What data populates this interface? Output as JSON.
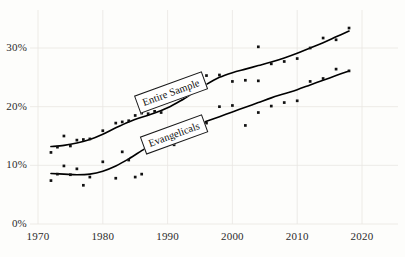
{
  "chart_data": {
    "type": "scatter",
    "title": "",
    "subtitle": "",
    "xlabel": "",
    "ylabel": "",
    "xlim": [
      1970,
      2020
    ],
    "ylim": [
      0,
      35
    ],
    "grid": true,
    "legend_position": "inline-annotation",
    "background_color": "#fdfdfb",
    "marker_color": "#111111",
    "line_color": "#000000",
    "grid_color": "#e8e6e2",
    "x_ticks": [
      1970,
      1980,
      1990,
      2000,
      2010,
      2020
    ],
    "x_tick_labels": [
      "1970",
      "1980",
      "1990",
      "2000",
      "2010",
      "2020"
    ],
    "y_ticks": [
      0,
      10,
      20,
      30
    ],
    "y_tick_labels": [
      "0%",
      "10%",
      "20%",
      "30%"
    ],
    "annotations": [
      {
        "text": "Entire Sample",
        "x": 1990.5,
        "y": 22.5,
        "rotation": -20
      },
      {
        "text": "Evangelicals",
        "x": 1991.0,
        "y": 15.2,
        "rotation": -20
      }
    ],
    "series": [
      {
        "name": "Entire Sample",
        "marker": "square",
        "points": [
          [
            1972,
            12.2
          ],
          [
            1973,
            13.1
          ],
          [
            1974,
            15.0
          ],
          [
            1975,
            13.3
          ],
          [
            1976,
            14.3
          ],
          [
            1977,
            14.4
          ],
          [
            1978,
            14.5
          ],
          [
            1980,
            15.9
          ],
          [
            1982,
            17.2
          ],
          [
            1983,
            17.4
          ],
          [
            1984,
            17.6
          ],
          [
            1985,
            18.5
          ],
          [
            1986,
            18.9
          ],
          [
            1987,
            18.8
          ],
          [
            1988,
            19.2
          ],
          [
            1989,
            19.0
          ],
          [
            1993,
            24.5
          ],
          [
            1996,
            25.3
          ],
          [
            1998,
            25.4
          ],
          [
            2000,
            24.3
          ],
          [
            2002,
            24.5
          ],
          [
            2004,
            30.2
          ],
          [
            2004,
            24.4
          ],
          [
            2006,
            27.3
          ],
          [
            2008,
            27.7
          ],
          [
            2010,
            28.2
          ],
          [
            2012,
            30.0
          ],
          [
            2014,
            31.7
          ],
          [
            2016,
            31.4
          ],
          [
            2018,
            33.4
          ]
        ],
        "fit_curve": [
          [
            1972,
            13.2
          ],
          [
            1974,
            13.4
          ],
          [
            1976,
            13.8
          ],
          [
            1978,
            14.4
          ],
          [
            1980,
            15.3
          ],
          [
            1982,
            16.4
          ],
          [
            1984,
            17.4
          ],
          [
            1986,
            18.2
          ],
          [
            1988,
            18.9
          ],
          [
            1990,
            19.8
          ],
          [
            1992,
            21.0
          ],
          [
            1994,
            22.4
          ],
          [
            1996,
            23.8
          ],
          [
            1998,
            25.0
          ],
          [
            2000,
            25.8
          ],
          [
            2002,
            26.4
          ],
          [
            2004,
            27.0
          ],
          [
            2006,
            27.6
          ],
          [
            2008,
            28.3
          ],
          [
            2010,
            29.1
          ],
          [
            2012,
            30.0
          ],
          [
            2014,
            30.9
          ],
          [
            2016,
            31.9
          ],
          [
            2018,
            32.9
          ]
        ]
      },
      {
        "name": "Evangelicals",
        "marker": "square",
        "points": [
          [
            1972,
            7.4
          ],
          [
            1973,
            8.5
          ],
          [
            1974,
            9.9
          ],
          [
            1975,
            8.4
          ],
          [
            1976,
            9.4
          ],
          [
            1977,
            6.6
          ],
          [
            1978,
            8.0
          ],
          [
            1980,
            10.6
          ],
          [
            1982,
            7.8
          ],
          [
            1983,
            12.3
          ],
          [
            1984,
            10.9
          ],
          [
            1985,
            8.0
          ],
          [
            1986,
            8.5
          ],
          [
            1987,
            12.8
          ],
          [
            1988,
            13.0
          ],
          [
            1989,
            14.3
          ],
          [
            1991,
            13.5
          ],
          [
            1993,
            15.8
          ],
          [
            1996,
            17.2
          ],
          [
            1998,
            20.0
          ],
          [
            2000,
            20.2
          ],
          [
            2002,
            16.8
          ],
          [
            2004,
            19.0
          ],
          [
            2006,
            20.1
          ],
          [
            2008,
            20.7
          ],
          [
            2010,
            21.0
          ],
          [
            2012,
            24.3
          ],
          [
            2014,
            24.8
          ],
          [
            2016,
            26.4
          ],
          [
            2018,
            26.1
          ]
        ],
        "fit_curve": [
          [
            1972,
            8.6
          ],
          [
            1974,
            8.5
          ],
          [
            1976,
            8.4
          ],
          [
            1978,
            8.5
          ],
          [
            1980,
            9.0
          ],
          [
            1982,
            9.9
          ],
          [
            1984,
            11.1
          ],
          [
            1986,
            12.5
          ],
          [
            1988,
            13.9
          ],
          [
            1990,
            15.0
          ],
          [
            1992,
            15.9
          ],
          [
            1994,
            16.7
          ],
          [
            1996,
            17.5
          ],
          [
            1998,
            18.3
          ],
          [
            2000,
            19.1
          ],
          [
            2002,
            19.9
          ],
          [
            2004,
            20.7
          ],
          [
            2006,
            21.5
          ],
          [
            2008,
            22.2
          ],
          [
            2010,
            22.9
          ],
          [
            2012,
            23.7
          ],
          [
            2014,
            24.5
          ],
          [
            2016,
            25.3
          ],
          [
            2018,
            26.1
          ]
        ]
      }
    ]
  }
}
